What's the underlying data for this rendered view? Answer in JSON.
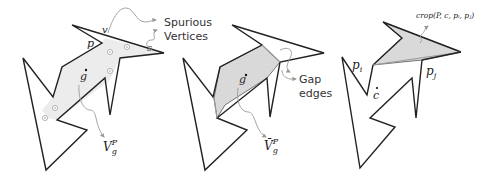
{
  "figure": {
    "panels": [
      {
        "id": "panel-1",
        "labels": {
          "v": "v",
          "p": "p",
          "s": "s",
          "g": "g",
          "vis_polygon": "V",
          "vis_sub": "g",
          "vis_sup": "P"
        },
        "annotation": {
          "line1": "Spurious",
          "line2": "Vertices"
        }
      },
      {
        "id": "panel-2",
        "labels": {
          "g": "g",
          "vis_polygon": "V̄",
          "vis_sub": "g",
          "vis_sup": "P"
        },
        "annotation": {
          "line1": "Gap",
          "line2": "edges"
        }
      },
      {
        "id": "panel-3",
        "labels": {
          "pi": "p",
          "pi_sub": "i",
          "pj": "p",
          "pj_sub": "j",
          "c": "c"
        },
        "annotation": {
          "crop": "crop(P, c, pᵢ, pⱼ)"
        }
      }
    ]
  }
}
